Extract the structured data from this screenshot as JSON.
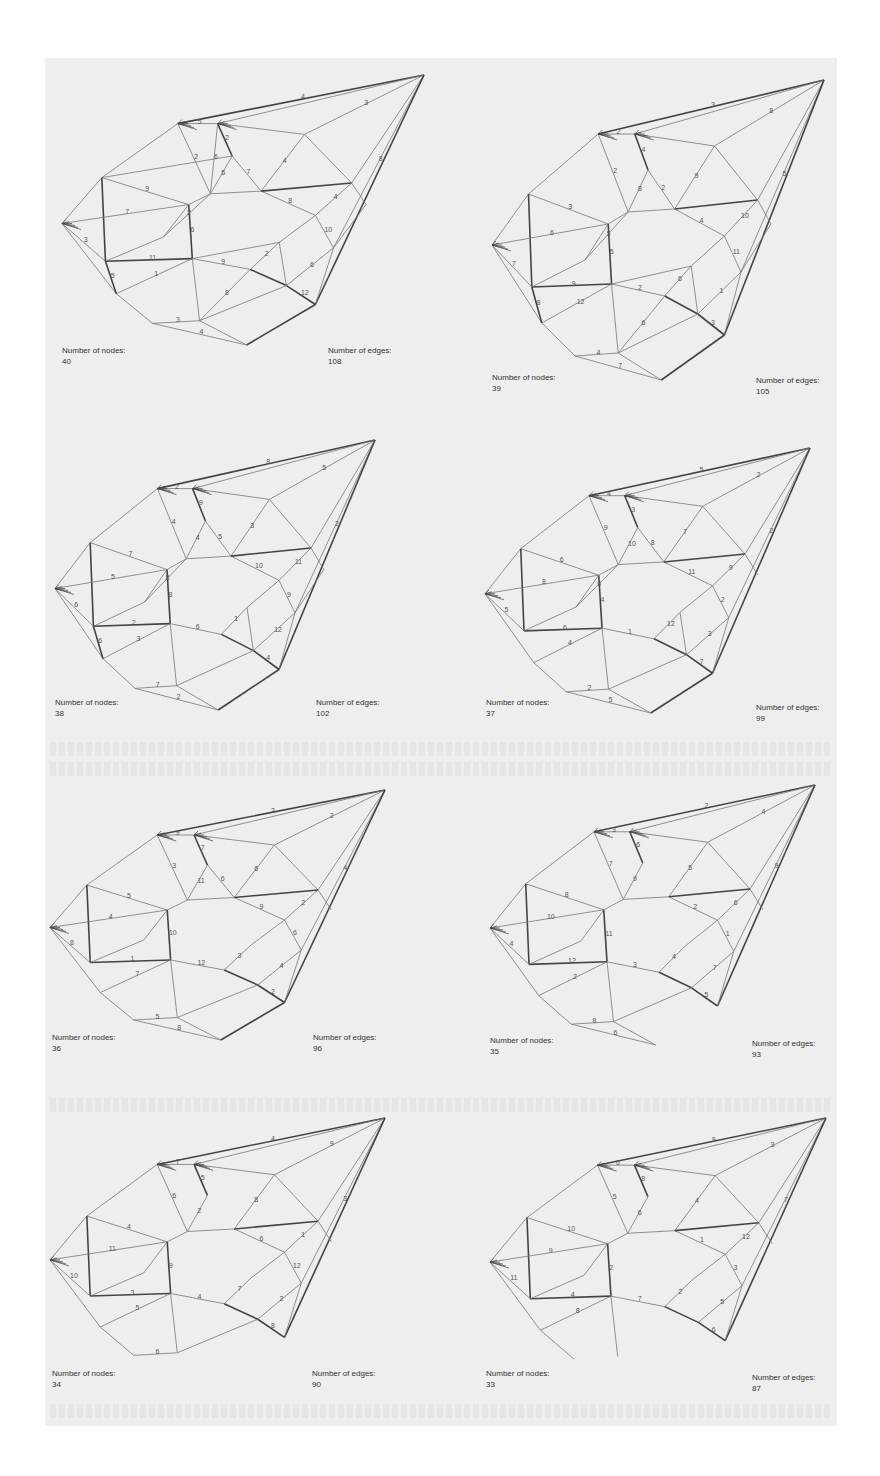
{
  "figure": {
    "background": "#eeeeee",
    "edge_color": "#444444",
    "edge_color_light": "#777777",
    "panels": [
      {
        "nodes_label": "Number of nodes:",
        "nodes": "40",
        "edges_label": "Number of edges:",
        "edges": "108",
        "box": {
          "x": 62,
          "y": 75,
          "w": 362,
          "h": 270
        },
        "nodes_pos": {
          "x": 62,
          "y": 345
        },
        "edges_pos": {
          "x": 328,
          "y": 345
        }
      },
      {
        "nodes_label": "Number of nodes:",
        "nodes": "39",
        "edges_label": "Number of edges:",
        "edges": "105",
        "box": {
          "x": 492,
          "y": 80,
          "w": 332,
          "h": 300
        },
        "nodes_pos": {
          "x": 492,
          "y": 372
        },
        "edges_pos": {
          "x": 756,
          "y": 375
        }
      },
      {
        "nodes_label": "Number of nodes:",
        "nodes": "38",
        "edges_label": "Number of edges:",
        "edges": "102",
        "box": {
          "x": 55,
          "y": 440,
          "w": 320,
          "h": 270
        },
        "nodes_pos": {
          "x": 55,
          "y": 697
        },
        "edges_pos": {
          "x": 316,
          "y": 697
        }
      },
      {
        "nodes_label": "Number of nodes:",
        "nodes": "37",
        "edges_label": "Number of edges:",
        "edges": "99",
        "box": {
          "x": 485,
          "y": 448,
          "w": 325,
          "h": 265
        },
        "nodes_pos": {
          "x": 486,
          "y": 697
        },
        "edges_pos": {
          "x": 756,
          "y": 702
        }
      },
      {
        "nodes_label": "Number of nodes:",
        "nodes": "36",
        "edges_label": "Number of edges:",
        "edges": "96",
        "box": {
          "x": 50,
          "y": 790,
          "w": 335,
          "h": 250
        },
        "nodes_pos": {
          "x": 52,
          "y": 1032
        },
        "edges_pos": {
          "x": 313,
          "y": 1032
        }
      },
      {
        "nodes_label": "Number of nodes:",
        "nodes": "35",
        "edges_label": "Number of edges:",
        "edges": "93",
        "box": {
          "x": 490,
          "y": 785,
          "w": 325,
          "h": 260
        },
        "nodes_pos": {
          "x": 490,
          "y": 1035
        },
        "edges_pos": {
          "x": 752,
          "y": 1038
        }
      },
      {
        "nodes_label": "Number of nodes:",
        "nodes": "34",
        "edges_label": "Number of edges:",
        "edges": "90",
        "box": {
          "x": 50,
          "y": 1118,
          "w": 335,
          "h": 258
        },
        "nodes_pos": {
          "x": 52,
          "y": 1368
        },
        "edges_pos": {
          "x": 312,
          "y": 1368
        }
      },
      {
        "nodes_label": "Number of nodes:",
        "nodes": "33",
        "edges_label": "Number of edges:",
        "edges": "87",
        "box": {
          "x": 490,
          "y": 1118,
          "w": 336,
          "h": 262
        },
        "nodes_pos": {
          "x": 486,
          "y": 1368
        },
        "edges_pos": {
          "x": 752,
          "y": 1372
        }
      }
    ]
  },
  "graph_template": {
    "nodes": [
      [
        1.0,
        0.0
      ],
      [
        0.32,
        0.18
      ],
      [
        0.43,
        0.18
      ],
      [
        0.67,
        0.22
      ],
      [
        0.11,
        0.38
      ],
      [
        0.0,
        0.55
      ],
      [
        0.35,
        0.48
      ],
      [
        0.41,
        0.44
      ],
      [
        0.55,
        0.43
      ],
      [
        0.8,
        0.4
      ],
      [
        0.7,
        0.52
      ],
      [
        0.12,
        0.69
      ],
      [
        0.36,
        0.68
      ],
      [
        0.52,
        0.72
      ],
      [
        0.75,
        0.64
      ],
      [
        0.15,
        0.81
      ],
      [
        0.62,
        0.78
      ],
      [
        0.38,
        0.91
      ],
      [
        0.25,
        0.92
      ],
      [
        0.7,
        0.85
      ],
      [
        0.51,
        1.0
      ],
      [
        0.47,
        0.3
      ],
      [
        0.6,
        0.62
      ],
      [
        0.28,
        0.6
      ],
      [
        0.84,
        0.48
      ]
    ],
    "edges": [
      [
        0,
        1
      ],
      [
        0,
        2
      ],
      [
        0,
        3
      ],
      [
        0,
        9
      ],
      [
        0,
        14
      ],
      [
        0,
        19
      ],
      [
        1,
        2
      ],
      [
        1,
        4
      ],
      [
        1,
        7
      ],
      [
        2,
        3
      ],
      [
        2,
        21
      ],
      [
        3,
        9
      ],
      [
        3,
        8
      ],
      [
        4,
        5
      ],
      [
        4,
        6
      ],
      [
        4,
        11
      ],
      [
        5,
        11
      ],
      [
        5,
        15
      ],
      [
        5,
        6
      ],
      [
        6,
        7
      ],
      [
        6,
        12
      ],
      [
        6,
        23
      ],
      [
        7,
        21
      ],
      [
        7,
        8
      ],
      [
        8,
        10
      ],
      [
        8,
        9
      ],
      [
        9,
        10
      ],
      [
        9,
        24
      ],
      [
        10,
        14
      ],
      [
        10,
        22
      ],
      [
        11,
        12
      ],
      [
        11,
        23
      ],
      [
        12,
        13
      ],
      [
        12,
        17
      ],
      [
        13,
        22
      ],
      [
        13,
        16
      ],
      [
        14,
        16
      ],
      [
        14,
        19
      ],
      [
        15,
        12
      ],
      [
        15,
        18
      ],
      [
        16,
        19
      ],
      [
        16,
        17
      ],
      [
        17,
        18
      ],
      [
        17,
        20
      ],
      [
        18,
        20
      ],
      [
        19,
        20
      ],
      [
        21,
        8
      ],
      [
        22,
        16
      ],
      [
        23,
        7
      ],
      [
        24,
        14
      ],
      [
        11,
        15
      ],
      [
        12,
        22
      ],
      [
        13,
        17
      ],
      [
        4,
        21
      ],
      [
        2,
        7
      ]
    ],
    "labels": [
      "4",
      "3",
      "8",
      "5",
      "2",
      "2",
      "4",
      "9",
      "3",
      "7",
      "6",
      "5",
      "8",
      "4",
      "10",
      "11",
      "9",
      "2",
      "6",
      "1",
      "12",
      "3",
      "4",
      "7",
      "2",
      "5",
      "8",
      "6",
      "10",
      "3"
    ]
  }
}
